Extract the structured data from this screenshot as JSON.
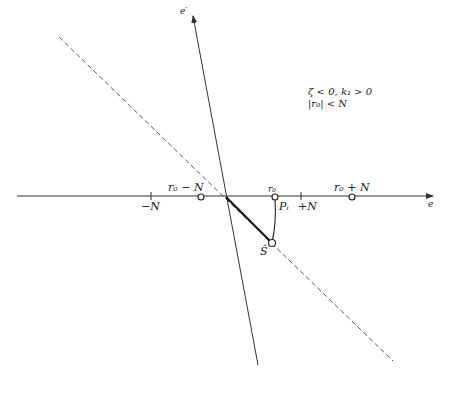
{
  "diagram": {
    "axes": {
      "horizontal_label": "e",
      "vertical_label": "e′"
    },
    "condition_text": {
      "line1": "ζ < 0, k₁ > 0",
      "line2": "|r₀| < N"
    },
    "points": {
      "r0_minus_N": "r₀ − N",
      "r0": "r₀",
      "r0_plus_N": "r₀ + N",
      "minus_N": "−N",
      "plus_N": "+N",
      "P_i": "Pᵢ",
      "S": "Ŝ"
    },
    "colors": {
      "line": "#333333",
      "background": "#ffffff"
    }
  }
}
